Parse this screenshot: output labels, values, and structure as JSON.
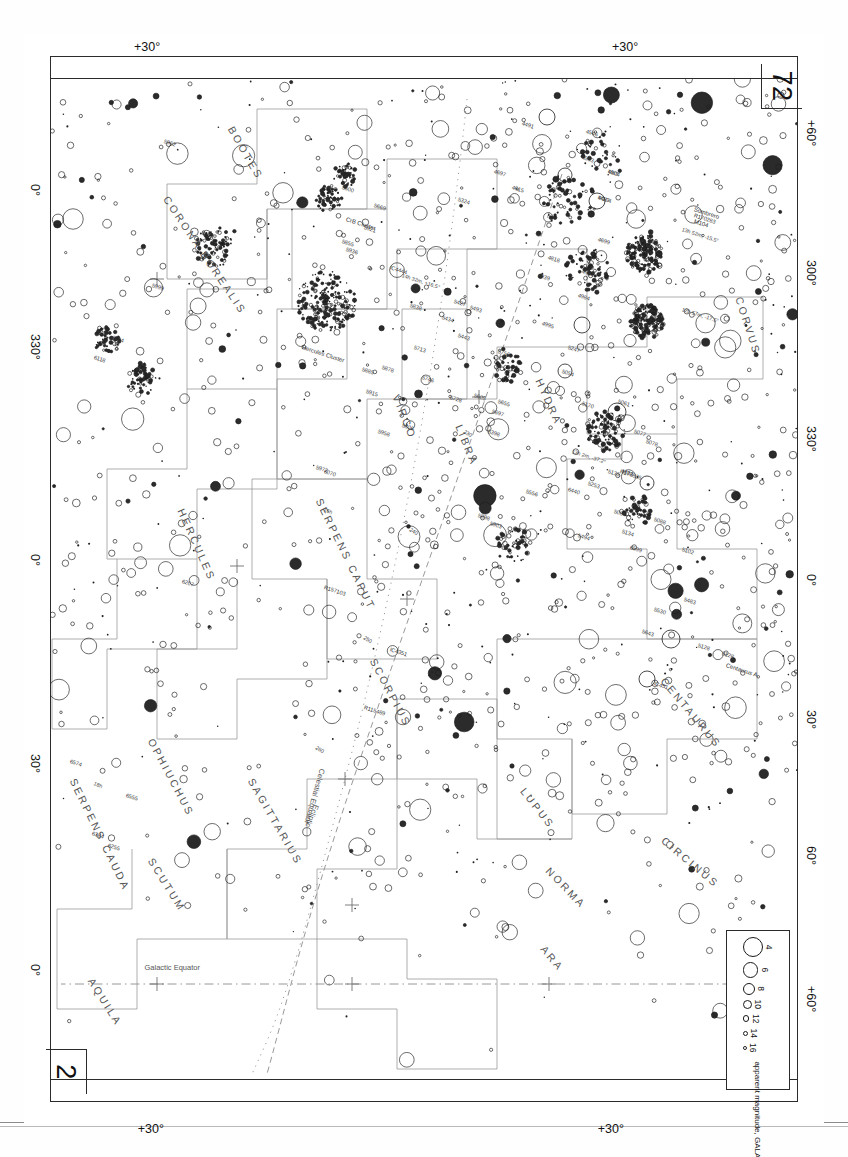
{
  "page": {
    "number_top_left": "72",
    "number_bottom_right": "2"
  },
  "legend": {
    "title": "apparent magnitude, GALAXIES",
    "magnitudes": [
      "4",
      "6",
      "8",
      "10",
      "12",
      "14",
      "16"
    ],
    "sizes_px": [
      18,
      13.5,
      10,
      7,
      4.6,
      3,
      1.8
    ]
  },
  "axes": {
    "left_label": "galactic longitude",
    "left_ticks": [
      "+60°",
      "300°",
      "330°",
      "0°",
      "30°",
      "60°",
      "+60°"
    ],
    "top_ticks": [
      "+30°"
    ],
    "bottom_ticks": [
      "+30°"
    ],
    "right_ticks": [
      "0°",
      "330°",
      "0°",
      "30°",
      "0°"
    ]
  },
  "reference_lines": [
    {
      "name": "Celestial Equator",
      "label": "Celestial Equator",
      "style": "dotted"
    },
    {
      "name": "Ecliptic",
      "label": "Ecliptic",
      "style": "dashed"
    },
    {
      "name": "Galactic Equator",
      "label": "Galactic Equator",
      "style": "dash-dot"
    }
  ],
  "ecliptic_ticks": [
    "230",
    "240",
    "250",
    "260"
  ],
  "ra_markers": [
    "18h",
    "16h"
  ],
  "constellations": [
    "CORVUS",
    "HYDRA",
    "VIRGO",
    "LIBRA",
    "CENTAURUS",
    "CIRCINUS",
    "LUPUS",
    "NORMA",
    "ARA",
    "SCORPIUS",
    "SAGITTARIUS",
    "OPHIUCHUS",
    "SCUTUM",
    "SERPENS CAPUT",
    "SERPENS CAUDA",
    "HERCULES",
    "CORONA BOREALIS",
    "BOÖTES",
    "AQUILA"
  ],
  "named_objects": [
    {
      "name": "Sombrero",
      "catalog": "M104"
    },
    {
      "name": "Centaurus A",
      "catalog": "5128"
    },
    {
      "name": "M83",
      "catalog": "M83"
    },
    {
      "name": "Hercules Cluster",
      "catalog": "Hercules Cluster"
    },
    {
      "name": "CrB Cluster",
      "catalog": "CrB Cluster"
    }
  ],
  "coordinate_callouts": [
    "13h 52m, -15.5°",
    "12h 57m, -17.5°",
    "13h 2m, -37.2°",
    "14h 32m, +16.5°"
  ],
  "catalog_labels": [
    "4487",
    "4504",
    "4593",
    "4546",
    "4491",
    "4615",
    "4697",
    "4699",
    "4818",
    "4902",
    "4939",
    "4984",
    "4995",
    "5054",
    "5061",
    "5077",
    "5078",
    "5084",
    "5088",
    "5102",
    "5128",
    "5134",
    "5135",
    "5170",
    "5247",
    "5253",
    "5324",
    "5398",
    "5427",
    "5434",
    "5443",
    "5483",
    "5493",
    "5494",
    "5530",
    "5556",
    "5600",
    "5605",
    "5643",
    "5655",
    "5669",
    "5697",
    "5713",
    "5728",
    "5746",
    "5756",
    "5806",
    "5838",
    "5855",
    "5878",
    "5885",
    "5898",
    "5903",
    "5915",
    "5921",
    "5936",
    "5958",
    "5962",
    "5972",
    "5999",
    "6070",
    "6104",
    "6118",
    "6207",
    "6255",
    "6384",
    "6555",
    "6574",
    "6599",
    "6440",
    "IC451",
    "IC4351",
    "IC4444",
    "R115489",
    "R157103",
    "R170283",
    "R178835",
    "M104",
    "M83"
  ],
  "chart_data": {
    "type": "scatter",
    "xlabel": "galactic longitude",
    "ylabel": "galactic latitude",
    "marker_meaning": "apparent magnitude, GALAXIES",
    "magnitude_bins": [
      4,
      6,
      8,
      10,
      12,
      14,
      16
    ],
    "n_points_drawn": 1900,
    "grid": "dotted celestial equator, dashed ecliptic, dash-dot galactic equator",
    "legend_position": "top-right"
  }
}
